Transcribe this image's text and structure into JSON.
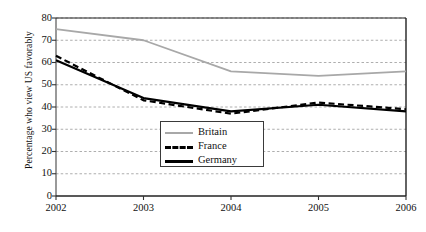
{
  "chart_data": {
    "type": "line",
    "title": "",
    "xlabel": "",
    "ylabel": "Percentage who view US favorably",
    "categories": [
      "2002",
      "2003",
      "2004",
      "2005",
      "2006"
    ],
    "x": [
      2002,
      2003,
      2004,
      2005,
      2006
    ],
    "ylim": [
      0,
      80
    ],
    "yticks": [
      0,
      10,
      20,
      30,
      40,
      50,
      60,
      70,
      80
    ],
    "grid": "horizontal-dashed",
    "legend_position": "center-bottom-inside",
    "series": [
      {
        "name": "Britain",
        "values": [
          75,
          70,
          56,
          54,
          56
        ],
        "color": "#a8a8a8",
        "style": "solid"
      },
      {
        "name": "France",
        "values": [
          63,
          43,
          37,
          42,
          39
        ],
        "color": "#000000",
        "style": "dashed"
      },
      {
        "name": "Germany",
        "values": [
          61,
          44,
          38,
          41,
          38
        ],
        "color": "#000000",
        "style": "solid"
      }
    ]
  },
  "axis": {
    "y_tick_labels": [
      "80",
      "70",
      "60",
      "50",
      "40",
      "30",
      "20",
      "10",
      "0"
    ],
    "x_tick_labels": [
      "2002",
      "2003",
      "2004",
      "2005",
      "2006"
    ],
    "y_axis_title": "Percentage who view US favorably"
  },
  "legend": {
    "items": [
      {
        "label": "Britain"
      },
      {
        "label": "France"
      },
      {
        "label": "Germany"
      }
    ]
  }
}
